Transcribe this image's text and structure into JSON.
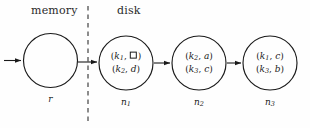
{
  "figure": {
    "width": 310,
    "height": 128,
    "background": "#fefefe",
    "stroke_color": "#1a1a1a",
    "divider": {
      "name": "memory-disk-divider",
      "style": "dashed",
      "x": 88,
      "y_top": 6,
      "y_bottom": 122
    }
  },
  "regions": [
    {
      "id": "memory",
      "label": "memory"
    },
    {
      "id": "disk",
      "label": "disk"
    }
  ],
  "nodes": [
    {
      "id": "r",
      "region": "memory",
      "label": "r",
      "label_sub": "",
      "cx": 50.5,
      "cy": 60.5,
      "r": 27,
      "entries": []
    },
    {
      "id": "n1",
      "region": "disk",
      "label": "n",
      "label_sub": "1",
      "cx": 126,
      "cy": 63,
      "r": 27,
      "entries": [
        {
          "key": "k",
          "key_sub": "1",
          "value": "□",
          "value_is_tombstone": true
        },
        {
          "key": "k",
          "key_sub": "2",
          "value": "d",
          "value_is_tombstone": false
        }
      ]
    },
    {
      "id": "n2",
      "region": "disk",
      "label": "n",
      "label_sub": "2",
      "cx": 199,
      "cy": 63,
      "r": 27,
      "entries": [
        {
          "key": "k",
          "key_sub": "2",
          "value": "a",
          "value_is_tombstone": false
        },
        {
          "key": "k",
          "key_sub": "3",
          "value": "c",
          "value_is_tombstone": false
        }
      ]
    },
    {
      "id": "n3",
      "region": "disk",
      "label": "n",
      "label_sub": "3",
      "cx": 270,
      "cy": 63,
      "r": 27,
      "entries": [
        {
          "key": "k",
          "key_sub": "1",
          "value": "c",
          "value_is_tombstone": false
        },
        {
          "key": "k",
          "key_sub": "3",
          "value": "b",
          "value_is_tombstone": false
        }
      ]
    }
  ],
  "arrows": [
    {
      "id": "entry-arrow",
      "name": "entry-arrow-into-root",
      "x1": 4,
      "y1": 60.5,
      "x2": 22,
      "y2": 60.5
    },
    {
      "id": "r-to-n1",
      "name": "arrow-root-to-n1",
      "x1": 78,
      "y1": 62,
      "x2": 98,
      "y2": 62
    },
    {
      "id": "n1-to-n2",
      "name": "arrow-n1-to-n2",
      "x1": 154,
      "y1": 63,
      "x2": 171,
      "y2": 63
    },
    {
      "id": "n2-to-n3",
      "name": "arrow-n2-to-n3",
      "x1": 227,
      "y1": 63,
      "x2": 242,
      "y2": 63
    }
  ]
}
